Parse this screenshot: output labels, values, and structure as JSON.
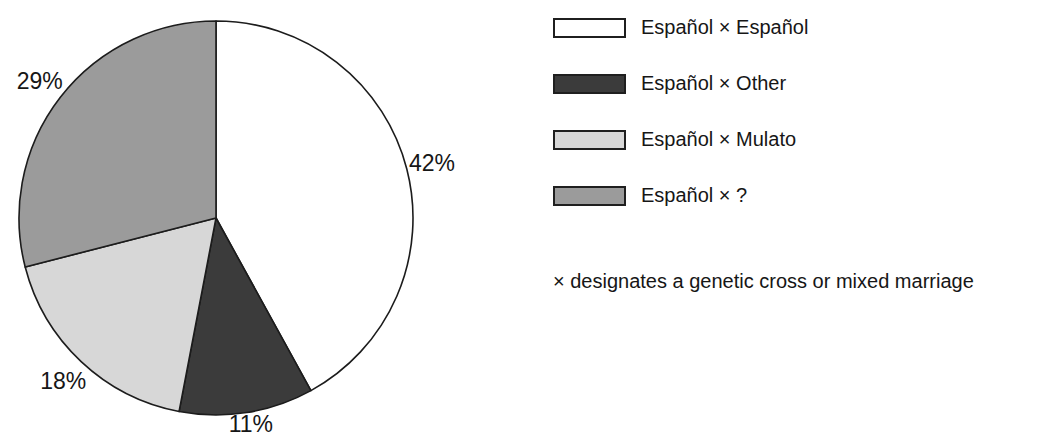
{
  "chart_data": {
    "type": "pie",
    "title": "",
    "categories": [
      "Español × Español",
      "Español × Other",
      "Español × Mulato",
      "Español × ?"
    ],
    "values": [
      42,
      11,
      18,
      29
    ],
    "slice_labels": [
      "42%",
      "11%",
      "18%",
      "29%"
    ],
    "colors": [
      "#ffffff",
      "#3b3b3b",
      "#d7d7d7",
      "#9b9b9b"
    ],
    "outline_color": "#1c1c1c",
    "start_angle": "12 o'clock",
    "direction": "clockwise",
    "legend_position": "right",
    "note": "× designates a genetic cross or mixed marriage"
  }
}
